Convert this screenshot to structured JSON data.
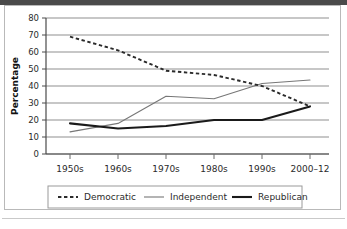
{
  "chart_data": {
    "type": "line",
    "title": "",
    "xlabel": "",
    "ylabel": "Percentage",
    "categories": [
      "1950s",
      "1960s",
      "1970s",
      "1980s",
      "1990s",
      "2000–12"
    ],
    "ylim": [
      0,
      80
    ],
    "ytick_step": 10,
    "yticks": [
      "0",
      "10",
      "20",
      "30",
      "40",
      "50",
      "60",
      "70",
      "80"
    ],
    "grid": "horizontal",
    "legend_position": "bottom",
    "series": [
      {
        "name": "Democratic",
        "style": "dashed",
        "color": "#2b2b2b",
        "values": [
          69,
          61,
          49,
          46.5,
          40,
          28
        ]
      },
      {
        "name": "Independent",
        "style": "solid-thin",
        "color": "#777777",
        "values": [
          13,
          18,
          34,
          32.5,
          41.5,
          43.5
        ]
      },
      {
        "name": "Republican",
        "style": "solid-thick",
        "color": "#1a1a1a",
        "values": [
          18,
          15,
          16.5,
          20,
          20,
          28
        ]
      }
    ]
  },
  "legend": {
    "items": [
      {
        "label": "Democratic"
      },
      {
        "label": "Independent"
      },
      {
        "label": "Republican"
      }
    ]
  },
  "axes": {
    "y_title": "Percentage",
    "y_ticks": [
      "80",
      "70",
      "60",
      "50",
      "40",
      "30",
      "20",
      "10",
      "0"
    ],
    "x_ticks": [
      "1950s",
      "1960s",
      "1970s",
      "1980s",
      "1990s",
      "2000–12"
    ]
  },
  "colors": {
    "democratic": "#2b2b2b",
    "independent": "#777777",
    "republican": "#1a1a1a",
    "grid": "#8f8f8f",
    "axis": "#4a4a4a",
    "frame": "#b9b9b9"
  }
}
